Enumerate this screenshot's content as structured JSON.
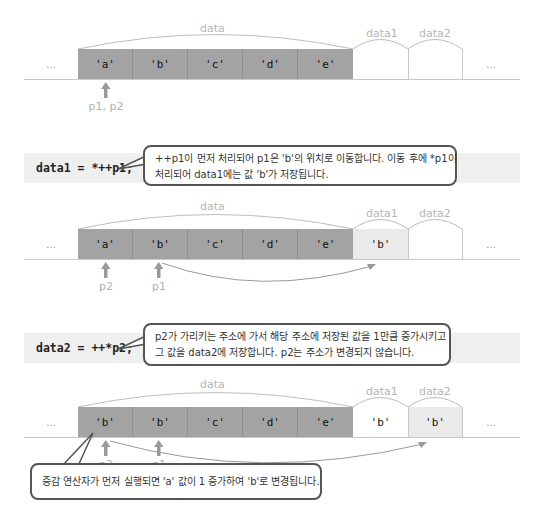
{
  "top_partial_text": "",
  "colors": {
    "array_cell": "#a3a3a3",
    "highlight_cell": "#eaeaea",
    "line": "#c8c8c8",
    "label": "#b5b5b5",
    "code_band": "#efefef",
    "callout_border": "#555555"
  },
  "stage1": {
    "labels": {
      "data": "data",
      "data1": "data1",
      "data2": "data2"
    },
    "cells": [
      "…",
      "'a'",
      "'b'",
      "'c'",
      "'d'",
      "'e'",
      "",
      "",
      "…"
    ],
    "pointer_label": "p1, p2"
  },
  "step1": {
    "code": "data1 = *++p1;",
    "callout_lines": [
      "++p1이 먼저 처리되어 p1은 'b'의 위치로 이동합니다. 이동 후에 *p1이",
      "처리되어 data1에는 값 'b'가 저장됩니다."
    ]
  },
  "stage2": {
    "labels": {
      "data": "data",
      "data1": "data1",
      "data2": "data2"
    },
    "cells": [
      "…",
      "'a'",
      "'b'",
      "'c'",
      "'d'",
      "'e'",
      "'b'",
      "",
      "…"
    ],
    "pointers": [
      "p2",
      "p1"
    ]
  },
  "step2": {
    "code": "data2 = ++*p2;",
    "callout_lines": [
      "p2가 가리키는 주소에 가서 해당 주소에 저장된 값을 1만큼 증가시키고",
      "그 값을 data2에 저장합니다. p2는 주소가 변경되지 않습니다."
    ]
  },
  "stage3": {
    "labels": {
      "data": "data",
      "data1": "data1",
      "data2": "data2"
    },
    "cells": [
      "…",
      "'b'",
      "'b'",
      "'c'",
      "'d'",
      "'e'",
      "'b'",
      "'b'",
      "…"
    ],
    "pointers": [
      "p2",
      "p1"
    ],
    "callout": "증감 연산자가 먼저 실행되면 'a' 값이 1 증가하여 'b'로 변경됩니다."
  }
}
